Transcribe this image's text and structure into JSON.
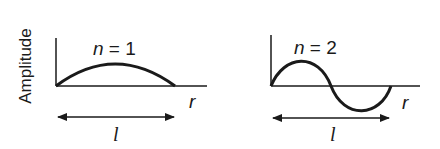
{
  "diagram": {
    "y_axis_label": "Amplitude",
    "panels": [
      {
        "n_var": "n",
        "n_eq": " = 1",
        "x_axis_label": "r",
        "length_label": "l",
        "mode": 1
      },
      {
        "n_var": "n",
        "n_eq": " = 2",
        "x_axis_label": "r",
        "length_label": "l",
        "mode": 2
      }
    ],
    "colors": {
      "stroke": "#1a1a1a",
      "background": "#ffffff"
    }
  }
}
